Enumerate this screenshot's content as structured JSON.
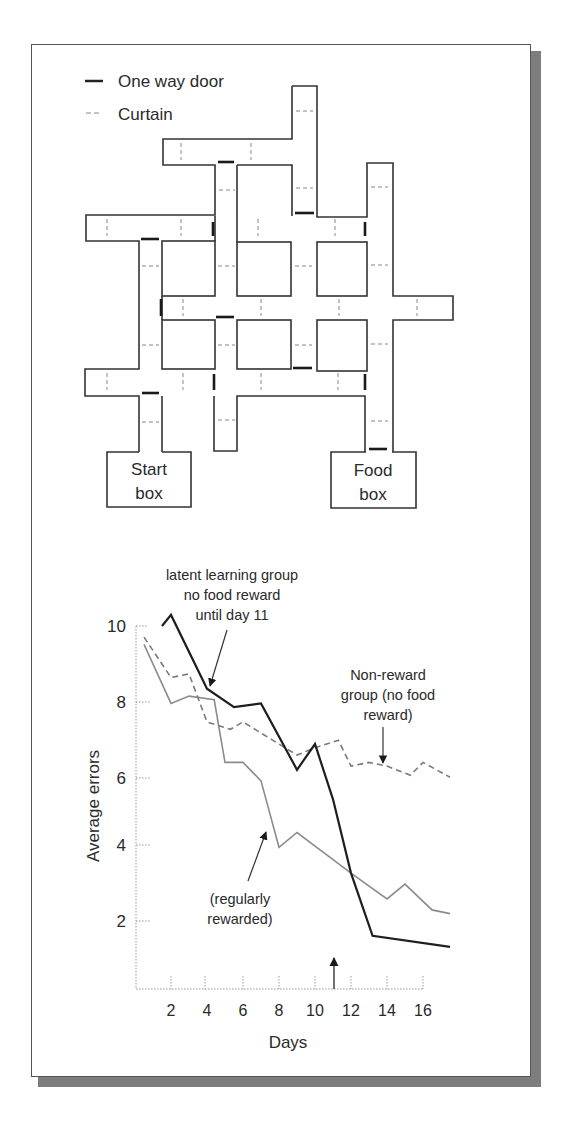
{
  "legend": {
    "items": [
      {
        "label": "One way door",
        "style": "solid-thick"
      },
      {
        "label": "Curtain",
        "style": "dashed"
      }
    ]
  },
  "maze": {
    "start_box": {
      "line1": "Start",
      "line2": "box"
    },
    "food_box": {
      "line1": "Food",
      "line2": "box"
    }
  },
  "annotations": {
    "latent": {
      "line1": "latent learning group",
      "line2": "no food reward",
      "line3": "until day 11"
    },
    "nonreward": {
      "line1": "Non-reward",
      "line2": "group (no food",
      "line3": "reward)"
    },
    "regular": {
      "line1": "(regularly",
      "line2": "rewarded)"
    }
  },
  "colors": {
    "latent_line": "#1e1e1e",
    "nonreward_line": "#7a7a7a",
    "regular_line": "#8c8c8c",
    "shadow": "#7d7d7d"
  },
  "chart_data": {
    "type": "line",
    "title": "",
    "xlabel": "Days",
    "ylabel": "Average errors",
    "x_ticks": [
      2,
      4,
      6,
      8,
      10,
      12,
      14,
      16
    ],
    "y_ticks": [
      2,
      4,
      6,
      8,
      10
    ],
    "xlim": [
      0,
      18
    ],
    "ylim": [
      0,
      10.5
    ],
    "grid": false,
    "annotation_arrow_day": 11,
    "series": [
      {
        "name": "latent learning group (no food reward until day 11)",
        "style": "solid-black",
        "x": [
          1.5,
          2,
          4,
          5.5,
          7,
          9,
          10,
          11,
          12,
          13.2,
          17.5
        ],
        "y": [
          10.0,
          10.3,
          8.3,
          7.8,
          7.9,
          6.1,
          6.8,
          5.3,
          3.3,
          1.6,
          1.3
        ]
      },
      {
        "name": "Non-reward group (no food reward)",
        "style": "dashed-gray",
        "x": [
          0.5,
          2,
          3,
          4,
          5.3,
          6,
          9,
          10,
          11.3,
          12,
          13,
          14,
          15.3,
          16,
          17.5
        ],
        "y": [
          9.7,
          8.6,
          8.7,
          7.4,
          7.2,
          7.4,
          6.5,
          6.7,
          6.9,
          6.2,
          6.3,
          6.2,
          5.95,
          6.3,
          5.9
        ]
      },
      {
        "name": "regularly rewarded",
        "style": "solid-gray",
        "x": [
          0.5,
          2,
          3,
          4.4,
          5,
          6,
          7,
          8,
          9,
          12,
          14,
          15,
          16.5,
          17.5
        ],
        "y": [
          9.5,
          7.9,
          8.1,
          8.0,
          6.3,
          6.3,
          5.8,
          4.0,
          4.4,
          3.3,
          2.6,
          3.0,
          2.3,
          2.2
        ]
      }
    ]
  }
}
